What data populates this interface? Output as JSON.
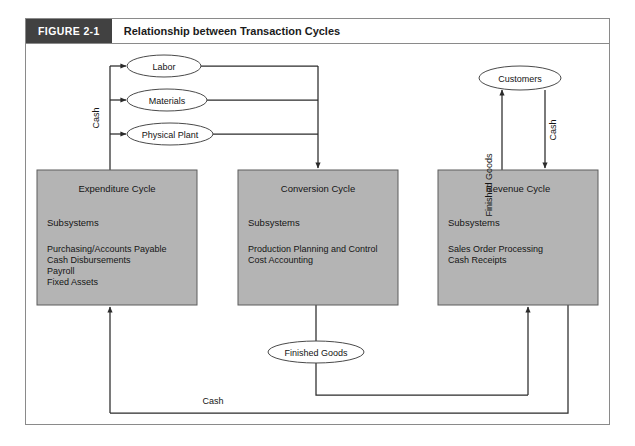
{
  "figure": {
    "number_label": "FIGURE 2-1",
    "title": "Relationship between Transaction Cycles"
  },
  "colors": {
    "box_fill": "#b4b4b4",
    "box_stroke": "#5d5d5d",
    "line": "#2b2b2b",
    "caption_label_bg": "#414141",
    "caption_label_text": "#ffffff",
    "frame_stroke": "#8a8a8a"
  },
  "boxes": [
    {
      "id": "expenditure",
      "title": "Expenditure Cycle",
      "subsystems_heading": "Subsystems",
      "items": [
        "Purchasing/Accounts Payable",
        "Cash Disbursements",
        "Payroll",
        "Fixed Assets"
      ]
    },
    {
      "id": "conversion",
      "title": "Conversion Cycle",
      "subsystems_heading": "Subsystems",
      "items": [
        "Production Planning and Control",
        "Cost Accounting"
      ]
    },
    {
      "id": "revenue",
      "title": "Revenue Cycle",
      "subsystems_heading": "Subsystems",
      "items": [
        "Sales Order Processing",
        "Cash Receipts"
      ]
    }
  ],
  "entities": [
    {
      "id": "labor",
      "label": "Labor"
    },
    {
      "id": "materials",
      "label": "Materials"
    },
    {
      "id": "physical-plant",
      "label": "Physical Plant"
    },
    {
      "id": "customers",
      "label": "Customers"
    },
    {
      "id": "finished-goods",
      "label": "Finished Goods"
    }
  ],
  "edge_labels": [
    {
      "id": "cash-left",
      "label": "Cash",
      "orientation": "vertical"
    },
    {
      "id": "finished-goods-right",
      "label": "Finished Goods",
      "orientation": "vertical"
    },
    {
      "id": "cash-right",
      "label": "Cash",
      "orientation": "vertical"
    },
    {
      "id": "cash-bottom",
      "label": "Cash",
      "orientation": "horizontal"
    }
  ]
}
